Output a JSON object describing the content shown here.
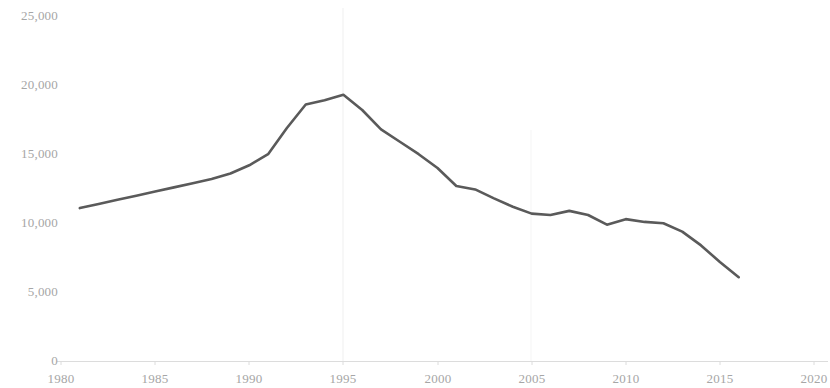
{
  "chart_data": {
    "type": "line",
    "title": "",
    "subtitle": "",
    "xlabel": "",
    "ylabel": "",
    "xlim": [
      1980,
      2020
    ],
    "ylim": [
      0,
      25000
    ],
    "grid": false,
    "legend": null,
    "x_ticks": [
      "1980",
      "1985",
      "1990",
      "1995",
      "2000",
      "2005",
      "2010",
      "2015",
      "2020"
    ],
    "x_tick_values": [
      1980,
      1985,
      1990,
      1995,
      2000,
      2005,
      2010,
      2015,
      2020
    ],
    "y_ticks": [
      "0",
      "5,000",
      "10,000",
      "15,000",
      "20,000",
      "25,000"
    ],
    "y_tick_values": [
      0,
      5000,
      10000,
      15000,
      20000,
      25000
    ],
    "series": [
      {
        "name": "series-1",
        "color": "#5a5a5a",
        "line_width": 2.6,
        "x": [
          1981,
          1982,
          1983,
          1984,
          1985,
          1986,
          1987,
          1988,
          1989,
          1990,
          1991,
          1992,
          1993,
          1994,
          1995,
          1996,
          1997,
          1998,
          1999,
          2000,
          2001,
          2002,
          2003,
          2004,
          2005,
          2006,
          2007,
          2008,
          2009,
          2010,
          2011,
          2012,
          2013,
          2014,
          2015,
          2016
        ],
        "values": [
          11100,
          11400,
          11700,
          12000,
          12300,
          12600,
          12900,
          13200,
          13600,
          14200,
          15000,
          16900,
          18600,
          18900,
          19300,
          18200,
          16800,
          15900,
          15000,
          14000,
          12700,
          12450,
          11800,
          11200,
          10700,
          10600,
          10900,
          10600,
          9900,
          10300,
          10100,
          10000,
          9400,
          8400,
          7200,
          6100
        ]
      }
    ]
  },
  "axes": {
    "y_axis_labels": [
      "25,000",
      "20,000",
      "15,000",
      "10,000",
      "5,000",
      "0"
    ],
    "x_axis_labels": [
      "1980",
      "1985",
      "1990",
      "1995",
      "2000",
      "2005",
      "2010",
      "2015",
      "2020"
    ]
  },
  "colors": {
    "line": "#5a5a5a",
    "axis": "#d9d9d9",
    "tick_text": "#a6a6a6",
    "gridline": "#f2f2f2",
    "background": "#ffffff"
  }
}
